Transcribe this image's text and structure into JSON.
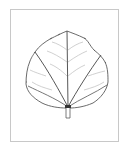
{
  "image": {
    "subject": "leaf line drawing",
    "description": "Botanical outline illustration of a broad, rounded leaf with palmate primary veins and short petiole, inside a thin gray border frame",
    "colors": {
      "background": "#ffffff",
      "frame_border": "#c8c8c8",
      "outline": "#555555",
      "primary_veins": "#444444",
      "secondary_veins": "#bbbbbb"
    }
  }
}
